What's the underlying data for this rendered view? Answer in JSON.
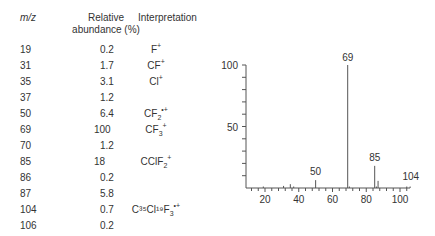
{
  "table": {
    "headers": {
      "mz": "m/z",
      "abundance_line1": "Relative",
      "abundance_line2": "abundance (%)",
      "interpretation": "Interpretation"
    },
    "rows": [
      {
        "mz": "19",
        "abundance": "0.2",
        "ion": "F",
        "sub": "",
        "sup": "+"
      },
      {
        "mz": "31",
        "abundance": "1.7",
        "ion": "CF",
        "sub": "",
        "sup": "+"
      },
      {
        "mz": "35",
        "abundance": "3.1",
        "ion": "Cl",
        "sub": "",
        "sup": "+"
      },
      {
        "mz": "37",
        "abundance": "1.2",
        "ion": "",
        "sub": "",
        "sup": ""
      },
      {
        "mz": "50",
        "abundance": "6.4",
        "ion": "CF",
        "sub": "2",
        "sup": "•+"
      },
      {
        "mz": "69",
        "abundance": "100",
        "ion": "CF",
        "sub": "3",
        "sup": "+"
      },
      {
        "mz": "70",
        "abundance": "1.2",
        "ion": "",
        "sub": "",
        "sup": ""
      },
      {
        "mz": "85",
        "abundance": "18",
        "ion": "CClF",
        "sub": "2",
        "sup": "+"
      },
      {
        "mz": "86",
        "abundance": "0.2",
        "ion": "",
        "sub": "",
        "sup": ""
      },
      {
        "mz": "87",
        "abundance": "5.8",
        "ion": "",
        "sub": "",
        "sup": ""
      },
      {
        "mz": "104",
        "abundance": "0.7",
        "ion": "C³⁵Cl¹⁹F",
        "sub": "3",
        "sup": "•+"
      },
      {
        "mz": "106",
        "abundance": "0.2",
        "ion": "",
        "sub": "",
        "sup": ""
      }
    ]
  },
  "chart_data": {
    "type": "bar",
    "title": "",
    "xlabel": "m/z",
    "ylabel": "Relative abundance (%)",
    "xlim": [
      10,
      108
    ],
    "ylim": [
      0,
      100
    ],
    "x_ticks": [
      "20",
      "40",
      "60",
      "80",
      "100"
    ],
    "y_ticks": [
      "50",
      "100"
    ],
    "peak_labels": [
      "69",
      "50",
      "85",
      "104"
    ],
    "x": [
      19,
      31,
      35,
      37,
      50,
      69,
      70,
      85,
      86,
      87,
      104,
      106
    ],
    "values": [
      0.2,
      1.7,
      3.1,
      1.2,
      6.4,
      100,
      1.2,
      18,
      0.2,
      5.8,
      0.7,
      0.2
    ],
    "grid": false
  }
}
